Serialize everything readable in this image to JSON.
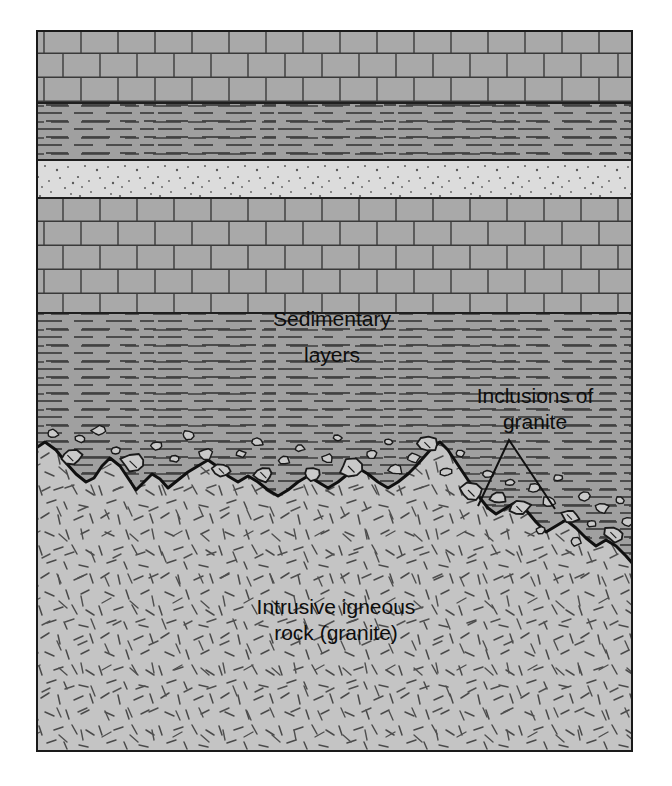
{
  "figure": {
    "kind": "geologic-cross-section",
    "title_visible": false,
    "background_color": "#ffffff",
    "frame": {
      "x": 36,
      "y": 30,
      "width": 597,
      "height": 722,
      "border_color": "#1a1a1a",
      "border_width": 2
    }
  },
  "labels": {
    "sedimentary_line1": "Sedimentary",
    "sedimentary_line2": "layers",
    "inclusions_line1": "Inclusions of",
    "inclusions_line2": "granite",
    "igneous_line1": "Intrusive igneous",
    "igneous_line2": "rock (granite)"
  },
  "label_positions": {
    "sedimentary": {
      "x": 296,
      "y1": 296,
      "y2": 332
    },
    "inclusions": {
      "x": 499,
      "y1": 373,
      "y2": 399
    },
    "igneous": {
      "x": 300,
      "y1": 584,
      "y2": 610
    }
  },
  "pointer": {
    "name": "inclusion-pointer-triangle",
    "apex": {
      "x": 473,
      "y": 410
    },
    "left_foot": {
      "x": 442,
      "y": 476
    },
    "right_foot": {
      "x": 519,
      "y": 479
    },
    "stroke": "#111111",
    "stroke_width": 2
  },
  "colors": {
    "limestone_fill": "#a9a9a9",
    "shale_fill": "#a0a0a0",
    "sandstone_fill": "#dcdcdc",
    "granite_fill": "#c4c4c4",
    "inclusion_fill": "#c9c9c9",
    "line_dark": "#2b2b2b",
    "contact_line": "#101010",
    "text": "#0d0d0d",
    "page_background": "#ffffff"
  },
  "layers": [
    {
      "id": "limestone-upper",
      "name": "Upper limestone",
      "pattern": "brick",
      "fill": "#a9a9a9",
      "top": 0,
      "bottom": 73,
      "rock_type": "sedimentary"
    },
    {
      "id": "shale-upper",
      "name": "Upper shale",
      "pattern": "horizontal-dashes",
      "fill": "#a0a0a0",
      "top": 73,
      "bottom": 130,
      "rock_type": "sedimentary"
    },
    {
      "id": "sandstone",
      "name": "Sandstone",
      "pattern": "stipple-dots",
      "fill": "#dcdcdc",
      "top": 130,
      "bottom": 168,
      "rock_type": "sedimentary"
    },
    {
      "id": "limestone-lower",
      "name": "Lower limestone",
      "pattern": "brick",
      "fill": "#a9a9a9",
      "top": 168,
      "bottom": 283,
      "rock_type": "sedimentary"
    },
    {
      "id": "shale-lower",
      "name": "Lower shale",
      "pattern": "horizontal-dashes",
      "fill": "#a0a0a0",
      "top": 283,
      "bottom": 500,
      "rock_type": "sedimentary"
    },
    {
      "id": "granite-pluton",
      "name": "Intrusive igneous rock (granite)",
      "pattern": "random-dashes",
      "fill": "#c4c4c4",
      "top": 395,
      "bottom": 722,
      "rock_type": "igneous-intrusive"
    }
  ],
  "contact": {
    "name": "intrusive-contact",
    "description": "Irregular jagged boundary between granite pluton below and sedimentary layers above, descending to the right",
    "stroke": "#101010",
    "stroke_width": 3,
    "points": [
      [
        0,
        418
      ],
      [
        9,
        412
      ],
      [
        20,
        420
      ],
      [
        31,
        434
      ],
      [
        40,
        444
      ],
      [
        50,
        452
      ],
      [
        58,
        448
      ],
      [
        66,
        436
      ],
      [
        74,
        428
      ],
      [
        84,
        436
      ],
      [
        92,
        448
      ],
      [
        100,
        460
      ],
      [
        108,
        452
      ],
      [
        116,
        444
      ],
      [
        124,
        449
      ],
      [
        132,
        458
      ],
      [
        142,
        450
      ],
      [
        152,
        442
      ],
      [
        162,
        436
      ],
      [
        172,
        430
      ],
      [
        182,
        437
      ],
      [
        192,
        446
      ],
      [
        202,
        452
      ],
      [
        212,
        446
      ],
      [
        222,
        452
      ],
      [
        232,
        460
      ],
      [
        242,
        466
      ],
      [
        252,
        460
      ],
      [
        262,
        452
      ],
      [
        272,
        446
      ],
      [
        282,
        452
      ],
      [
        292,
        458
      ],
      [
        302,
        452
      ],
      [
        312,
        444
      ],
      [
        322,
        438
      ],
      [
        332,
        444
      ],
      [
        342,
        452
      ],
      [
        352,
        458
      ],
      [
        362,
        452
      ],
      [
        372,
        444
      ],
      [
        380,
        436
      ],
      [
        388,
        427
      ],
      [
        396,
        418
      ],
      [
        404,
        412
      ],
      [
        412,
        420
      ],
      [
        420,
        432
      ],
      [
        428,
        444
      ],
      [
        436,
        456
      ],
      [
        444,
        468
      ],
      [
        452,
        478
      ],
      [
        460,
        484
      ],
      [
        470,
        478
      ],
      [
        480,
        472
      ],
      [
        490,
        480
      ],
      [
        500,
        492
      ],
      [
        510,
        502
      ],
      [
        520,
        496
      ],
      [
        530,
        490
      ],
      [
        540,
        498
      ],
      [
        550,
        508
      ],
      [
        560,
        516
      ],
      [
        570,
        510
      ],
      [
        580,
        516
      ],
      [
        590,
        526
      ],
      [
        597,
        534
      ]
    ]
  },
  "inclusions": {
    "name": "granite-inclusions",
    "description": "Angular blocks of granite (xenoliths) suspended in the sedimentary rock just above the contact",
    "fill": "#c9c9c9",
    "stroke": "#1a1a1a",
    "count": 44,
    "blobs": [
      {
        "cx": 16,
        "cy": 404,
        "r": 5,
        "rot": 10
      },
      {
        "cx": 44,
        "cy": 409,
        "r": 4,
        "rot": 30
      },
      {
        "cx": 35,
        "cy": 427,
        "r": 9,
        "rot": -15
      },
      {
        "cx": 63,
        "cy": 401,
        "r": 6,
        "rot": 48
      },
      {
        "cx": 80,
        "cy": 421,
        "r": 4,
        "rot": 5
      },
      {
        "cx": 98,
        "cy": 433,
        "r": 11,
        "rot": 22
      },
      {
        "cx": 120,
        "cy": 416,
        "r": 5,
        "rot": -40
      },
      {
        "cx": 138,
        "cy": 429,
        "r": 4,
        "rot": 15
      },
      {
        "cx": 152,
        "cy": 405,
        "r": 5,
        "rot": 60
      },
      {
        "cx": 170,
        "cy": 424,
        "r": 6,
        "rot": -25
      },
      {
        "cx": 186,
        "cy": 440,
        "r": 8,
        "rot": 12
      },
      {
        "cx": 205,
        "cy": 424,
        "r": 4,
        "rot": 70
      },
      {
        "cx": 222,
        "cy": 412,
        "r": 5,
        "rot": -10
      },
      {
        "cx": 228,
        "cy": 444,
        "r": 9,
        "rot": 35
      },
      {
        "cx": 248,
        "cy": 430,
        "r": 5,
        "rot": -55
      },
      {
        "cx": 264,
        "cy": 418,
        "r": 4,
        "rot": 20
      },
      {
        "cx": 276,
        "cy": 444,
        "r": 7,
        "rot": 8
      },
      {
        "cx": 292,
        "cy": 428,
        "r": 5,
        "rot": -30
      },
      {
        "cx": 302,
        "cy": 408,
        "r": 4,
        "rot": 45
      },
      {
        "cx": 316,
        "cy": 438,
        "r": 10,
        "rot": 18
      },
      {
        "cx": 336,
        "cy": 424,
        "r": 5,
        "rot": -18
      },
      {
        "cx": 352,
        "cy": 412,
        "r": 4,
        "rot": 52
      },
      {
        "cx": 360,
        "cy": 440,
        "r": 6,
        "rot": -5
      },
      {
        "cx": 378,
        "cy": 428,
        "r": 5,
        "rot": 28
      },
      {
        "cx": 392,
        "cy": 414,
        "r": 9,
        "rot": -42
      },
      {
        "cx": 410,
        "cy": 442,
        "r": 5,
        "rot": 16
      },
      {
        "cx": 424,
        "cy": 424,
        "r": 4,
        "rot": 64
      },
      {
        "cx": 436,
        "cy": 462,
        "r": 10,
        "rot": -22
      },
      {
        "cx": 452,
        "cy": 444,
        "r": 5,
        "rot": 33
      },
      {
        "cx": 462,
        "cy": 468,
        "r": 7,
        "rot": -12
      },
      {
        "cx": 474,
        "cy": 452,
        "r": 4,
        "rot": 50
      },
      {
        "cx": 484,
        "cy": 478,
        "r": 9,
        "rot": 25
      },
      {
        "cx": 498,
        "cy": 458,
        "r": 5,
        "rot": -35
      },
      {
        "cx": 512,
        "cy": 472,
        "r": 6,
        "rot": 14
      },
      {
        "cx": 522,
        "cy": 448,
        "r": 4,
        "rot": 58
      },
      {
        "cx": 534,
        "cy": 486,
        "r": 8,
        "rot": -20
      },
      {
        "cx": 548,
        "cy": 466,
        "r": 5,
        "rot": 40
      },
      {
        "cx": 556,
        "cy": 494,
        "r": 4,
        "rot": -8
      },
      {
        "cx": 566,
        "cy": 478,
        "r": 6,
        "rot": 26
      },
      {
        "cx": 578,
        "cy": 504,
        "r": 9,
        "rot": -48
      },
      {
        "cx": 584,
        "cy": 470,
        "r": 4,
        "rot": 11
      },
      {
        "cx": 592,
        "cy": 492,
        "r": 5,
        "rot": 36
      },
      {
        "cx": 540,
        "cy": 512,
        "r": 5,
        "rot": -28
      },
      {
        "cx": 504,
        "cy": 500,
        "r": 4,
        "rot": 62
      }
    ]
  }
}
